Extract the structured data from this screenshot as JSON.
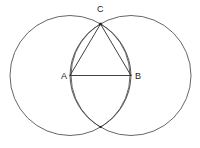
{
  "figure": {
    "canvas": {
      "width": 200,
      "height": 148,
      "background": "#ffffff"
    },
    "stroke_colors": {
      "circle": "#555555",
      "arc": "#4a4a4a",
      "triangle": "#2b2b2b",
      "label": "#1a1a1a"
    },
    "points": [
      {
        "id": "A",
        "label": "A",
        "x": 70,
        "y": 75.5,
        "label_x": 61,
        "label_y": 79,
        "marked": false
      },
      {
        "id": "B",
        "label": "B",
        "x": 131,
        "y": 75.5,
        "label_x": 135,
        "label_y": 79,
        "marked": false
      },
      {
        "id": "C",
        "label": "C",
        "x": 100.5,
        "y": 24,
        "label_x": 97,
        "label_y": 12,
        "marked": true
      },
      {
        "id": "D",
        "label": "",
        "x": 100.5,
        "y": 127,
        "label_x": 0,
        "label_y": 0,
        "marked": true
      }
    ],
    "circles": [
      {
        "id": "circle-a",
        "center_label": "A",
        "cx": 70,
        "cy": 75.5,
        "r": 60
      },
      {
        "id": "circle-b",
        "center_label": "B",
        "cx": 131,
        "cy": 75.5,
        "r": 60
      }
    ],
    "segments": [
      {
        "id": "segment-ab",
        "from": "A",
        "to": "B",
        "x1": 70,
        "y1": 75.5,
        "x2": 131,
        "y2": 75.5
      },
      {
        "id": "segment-ac",
        "from": "A",
        "to": "C",
        "x1": 70,
        "y1": 75.5,
        "x2": 100.5,
        "y2": 24
      },
      {
        "id": "segment-bc",
        "from": "B",
        "to": "C",
        "x1": 131,
        "y1": 75.5,
        "x2": 100.5,
        "y2": 24
      }
    ],
    "arcs": [
      {
        "id": "arc-a-to-c",
        "description": "arc of circle centered at B from A up to C",
        "d": "M 70 75.5 A 60 60 0 0 1 100.5 24"
      },
      {
        "id": "arc-b-to-c",
        "description": "arc of circle centered at A from B up to C",
        "d": "M 131 75.5 A 60 60 0 0 0 100.5 24"
      },
      {
        "id": "arc-a-to-d",
        "description": "arc of circle centered at B from A down to lower intersection",
        "d": "M 70 75.5 A 60 60 0 0 0 100.5 127"
      },
      {
        "id": "arc-b-to-d",
        "description": "arc of circle centered at A from B down to lower intersection",
        "d": "M 131 75.5 A 60 60 0 0 1 100.5 127"
      }
    ]
  }
}
